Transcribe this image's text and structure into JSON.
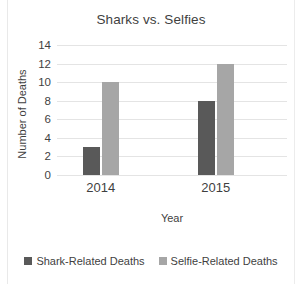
{
  "chart_data": {
    "type": "bar",
    "title": "Sharks vs. Selfies",
    "xlabel": "Year",
    "ylabel": "Number of Deaths",
    "categories": [
      "2014",
      "2015"
    ],
    "series": [
      {
        "name": "Shark-Related Deaths",
        "values": [
          3,
          8
        ],
        "color": "#595959"
      },
      {
        "name": "Selfie-Related Deaths",
        "values": [
          10,
          12
        ],
        "color": "#a6a6a6"
      }
    ],
    "ylim": [
      0,
      14
    ],
    "yticks": [
      0,
      2,
      4,
      6,
      8,
      10,
      12,
      14
    ],
    "ytick_labels": [
      "0",
      "2",
      "4",
      "6",
      "8",
      "10",
      "12",
      "14"
    ],
    "grid": "horizontal",
    "legend_position": "bottom",
    "gridline_color": "#e4e4e4",
    "text_color": "#3f3f3f",
    "background": "#ffffff"
  }
}
